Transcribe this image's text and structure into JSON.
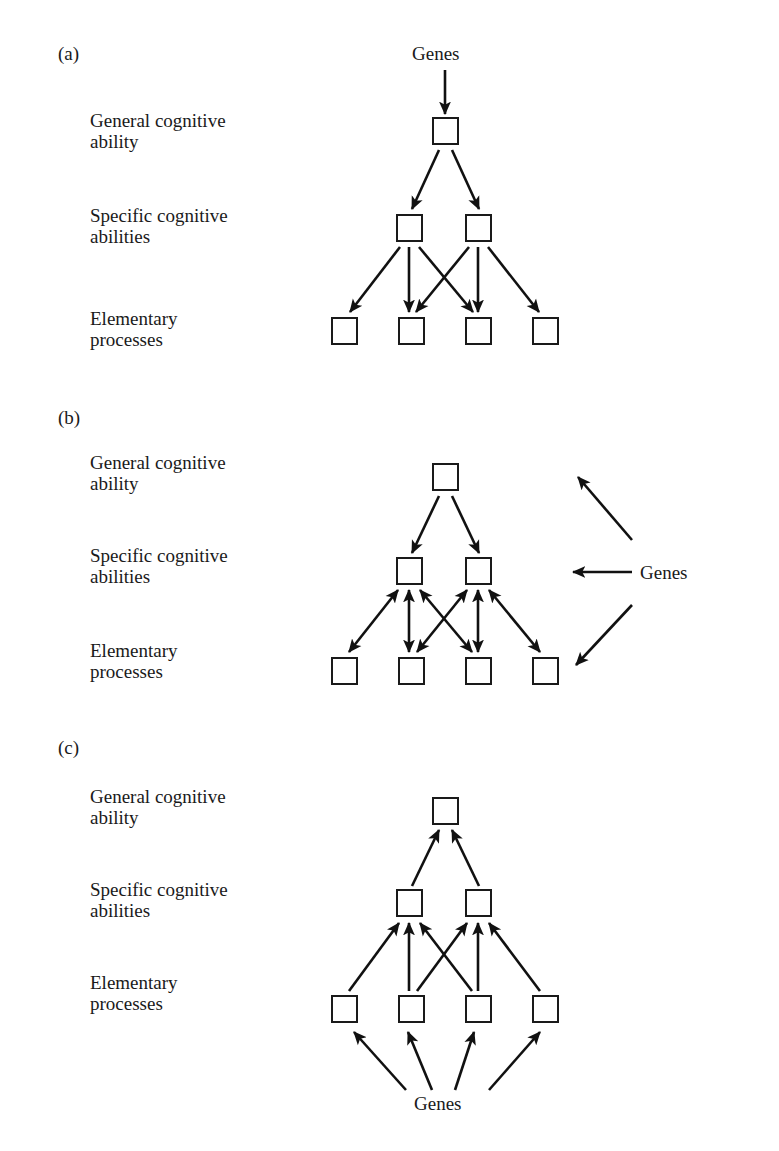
{
  "figure": {
    "title": "",
    "background": "#ffffff",
    "ink_color": "#111111",
    "panels": [
      {
        "id": "a",
        "letter": "(a)",
        "genes_label": "Genes",
        "genes_position": "top",
        "row_labels": [
          "General cognitive\nability",
          "Specific cognitive\nabilities",
          "Elementary\nprocesses"
        ],
        "node_counts": [
          1,
          2,
          4
        ],
        "arrow_direction": "top-down",
        "description": "Genes act on general cognitive ability, which influences specific cognitive abilities, which influence elementary processes."
      },
      {
        "id": "b",
        "letter": "(b)",
        "genes_label": "Genes",
        "genes_position": "right",
        "row_labels": [
          "General cognitive\nability",
          "Specific cognitive\nabilities",
          "Elementary\nprocesses"
        ],
        "node_counts": [
          1,
          2,
          4
        ],
        "arrow_direction": "mixed-bidirectional",
        "description": "Genes act on all three levels; specific abilities and elementary processes are reciprocally linked."
      },
      {
        "id": "c",
        "letter": "(c)",
        "genes_label": "Genes",
        "genes_position": "bottom",
        "row_labels": [
          "General cognitive\nability",
          "Specific cognitive\nabilities",
          "Elementary\nprocesses"
        ],
        "node_counts": [
          1,
          2,
          4
        ],
        "arrow_direction": "bottom-up",
        "description": "Genes act on elementary processes, which build up to specific cognitive abilities and then general cognitive ability."
      }
    ]
  }
}
